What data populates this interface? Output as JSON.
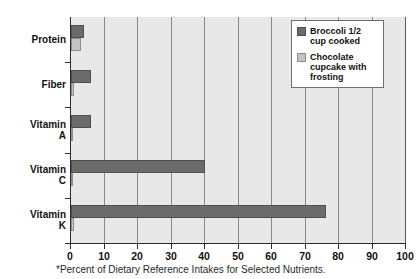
{
  "chart_data": {
    "type": "bar",
    "orientation": "horizontal",
    "title": "",
    "xlabel": "",
    "ylabel": "",
    "xlim": [
      0,
      100
    ],
    "xticks": [
      0,
      10,
      20,
      30,
      40,
      50,
      60,
      70,
      80,
      90,
      100
    ],
    "grid": true,
    "legend_position": "top-right-inside",
    "categories": [
      "Protein",
      "Fiber",
      "Vitamin A",
      "Vitamin C",
      "Vitamin K"
    ],
    "series": [
      {
        "name": "Broccoli 1/2 cup cooked",
        "color": "#6b6b6b",
        "values": [
          4,
          6,
          6,
          40,
          76
        ]
      },
      {
        "name": "Chocolate cupcake with frosting",
        "color": "#c4c4c4",
        "values": [
          3,
          1,
          0.5,
          0.5,
          1
        ]
      }
    ],
    "footnote": "*Percent of Dietary Reference Intakes for Selected Nutrients."
  },
  "categories": [
    {
      "label_line1": "Protein",
      "label_line2": ""
    },
    {
      "label_line1": "Fiber",
      "label_line2": ""
    },
    {
      "label_line1": "Vitamin",
      "label_line2": "A"
    },
    {
      "label_line1": "Vitamin",
      "label_line2": "C"
    },
    {
      "label_line1": "Vitamin",
      "label_line2": "K"
    }
  ],
  "xticklabels": [
    "0",
    "10",
    "20",
    "30",
    "40",
    "50",
    "60",
    "70",
    "80",
    "90",
    "100"
  ],
  "legend": {
    "items": [
      {
        "label": "Broccoli 1/2 cup cooked",
        "swatch": "dark-gray-swatch"
      },
      {
        "label": "Chocolate cupcake with frosting",
        "swatch": "light-gray-swatch"
      }
    ]
  },
  "footnote": "*Percent of Dietary Reference Intakes for Selected Nutrients.",
  "colors": {
    "broccoli": "#6b6b6b",
    "cupcake": "#c4c4c4",
    "plot_background": "#e8e8e8",
    "gridline": "#8a8a8a",
    "axis": "#2b2b2b"
  }
}
